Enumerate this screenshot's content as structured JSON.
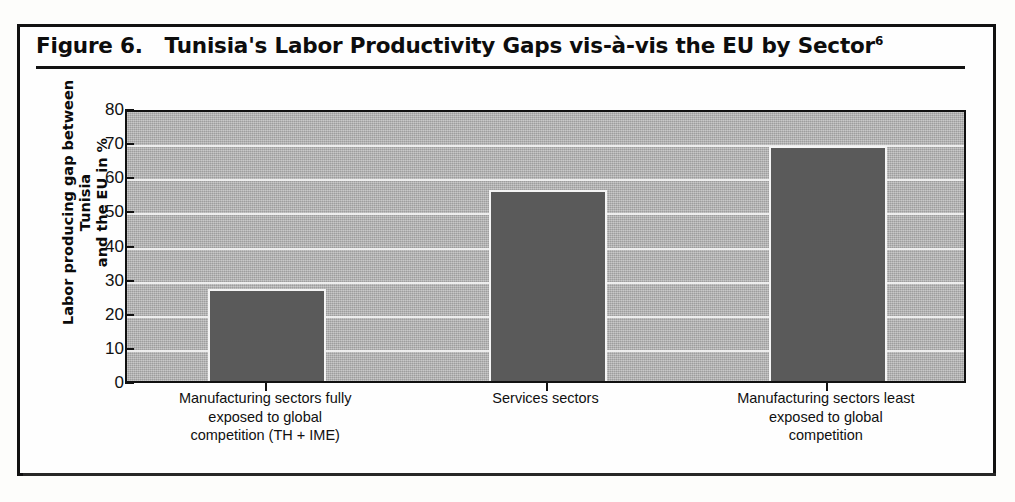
{
  "figure": {
    "title_prefix": "Figure 6.",
    "title_text": "Tunisia's Labor Productivity Gaps vis-à-vis the EU by Sector",
    "title_footnote": "6"
  },
  "chart_data": {
    "type": "bar",
    "categories": [
      "Manufacturing sectors fully exposed to global competition (TH + IME)",
      "Services sectors",
      "Manufacturing sectors least exposed to global competition"
    ],
    "category_lines": [
      [
        "Manufacturing sectors fully",
        "exposed to global",
        "competition (TH + IME)"
      ],
      [
        "Services sectors"
      ],
      [
        "Manufacturing sectors least",
        "exposed to global",
        "competition"
      ]
    ],
    "values": [
      27,
      56,
      69
    ],
    "xlabel": "",
    "ylabel": "Labor producing gap between Tunisia and the EU in %",
    "ylabel_lines": [
      "Labor producing gap between Tunisia",
      "and the EU in %"
    ],
    "ylim": [
      0,
      80
    ],
    "ytick_values": [
      80,
      70,
      60,
      50,
      40,
      30,
      20,
      10,
      0
    ],
    "grid": true,
    "legend": "none",
    "colors": {
      "bar_fill": "#5a5a5a",
      "bar_outline": "#f4f4f4",
      "plot_background": "#b4b4b4",
      "gridline": "#f2f2f2",
      "axis": "#111111",
      "text": "#101010"
    }
  }
}
